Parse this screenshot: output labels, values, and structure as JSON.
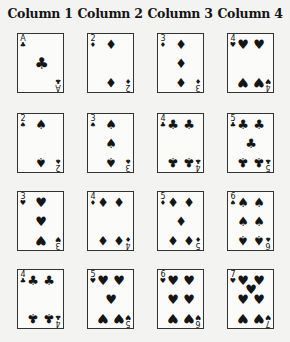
{
  "columns": [
    {
      "header": "Column 1",
      "cards": [
        {
          "rank": "A",
          "suit": "clubs",
          "glyph": "♣"
        },
        {
          "rank": "2",
          "suit": "spades",
          "glyph": "♠"
        },
        {
          "rank": "3",
          "suit": "hearts",
          "glyph": "♥"
        },
        {
          "rank": "4",
          "suit": "clubs",
          "glyph": "♣"
        }
      ]
    },
    {
      "header": "Column 2",
      "cards": [
        {
          "rank": "2",
          "suit": "diamonds",
          "glyph": "♦"
        },
        {
          "rank": "3",
          "suit": "spades",
          "glyph": "♠"
        },
        {
          "rank": "4",
          "suit": "diamonds",
          "glyph": "♦"
        },
        {
          "rank": "5",
          "suit": "hearts",
          "glyph": "♥"
        }
      ]
    },
    {
      "header": "Column 3",
      "cards": [
        {
          "rank": "3",
          "suit": "diamonds",
          "glyph": "♦"
        },
        {
          "rank": "4",
          "suit": "clubs",
          "glyph": "♣"
        },
        {
          "rank": "5",
          "suit": "diamonds",
          "glyph": "♦"
        },
        {
          "rank": "6",
          "suit": "hearts",
          "glyph": "♥"
        }
      ]
    },
    {
      "header": "Column 4",
      "cards": [
        {
          "rank": "4",
          "suit": "hearts",
          "glyph": "♥"
        },
        {
          "rank": "5",
          "suit": "clubs",
          "glyph": "♣"
        },
        {
          "rank": "6",
          "suit": "spades",
          "glyph": "♠"
        },
        {
          "rank": "7",
          "suit": "hearts",
          "glyph": "♥"
        }
      ]
    }
  ]
}
